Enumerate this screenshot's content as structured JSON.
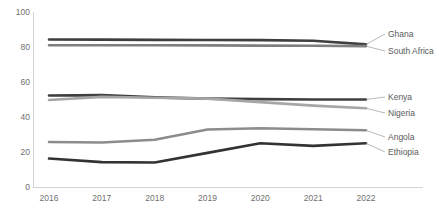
{
  "chart": {
    "type": "line",
    "title": "",
    "xlabel": "",
    "ylabel": ""
  },
  "axes": {
    "y_ticks": [
      "0",
      "20",
      "40",
      "60",
      "80",
      "100"
    ],
    "x_ticks": [
      "2016",
      "2017",
      "2018",
      "2019",
      "2020",
      "2021",
      "2022"
    ]
  },
  "labels": {
    "ghana": "Ghana",
    "south_africa": "South Africa",
    "kenya": "Kenya",
    "nigeria": "Nigeria",
    "angola": "Angola",
    "ethiopia": "Ethiopia"
  },
  "chart_data": {
    "type": "line",
    "title": "",
    "xlabel": "",
    "ylabel": "",
    "x": [
      2016,
      2017,
      2018,
      2019,
      2020,
      2021,
      2022
    ],
    "categories": [
      "2016",
      "2017",
      "2018",
      "2019",
      "2020",
      "2021",
      "2022"
    ],
    "ylim": [
      0,
      100
    ],
    "xlim": [
      2016,
      2022
    ],
    "yticks": [
      0,
      20,
      40,
      60,
      80,
      100
    ],
    "grid": false,
    "legend": "right-inline-labels",
    "series": [
      {
        "name": "Ghana",
        "color": "#3f3f3f",
        "values": [
          84.3,
          84.2,
          84.1,
          84.0,
          83.9,
          83.6,
          81.5
        ]
      },
      {
        "name": "South Africa",
        "color": "#7f7f7f",
        "values": [
          81.0,
          81.0,
          81.0,
          80.9,
          80.8,
          80.7,
          80.5
        ]
      },
      {
        "name": "Kenya",
        "color": "#3f3f3f",
        "values": [
          52.3,
          52.5,
          51.2,
          50.5,
          50.2,
          50.0,
          50.0
        ]
      },
      {
        "name": "Nigeria",
        "color": "#a6a6a6",
        "values": [
          49.7,
          51.5,
          51.0,
          50.5,
          48.5,
          46.5,
          45.0
        ]
      },
      {
        "name": "Angola",
        "color": "#8c8c8c",
        "values": [
          25.7,
          25.4,
          27.0,
          32.9,
          33.6,
          33.0,
          32.4
        ]
      },
      {
        "name": "Ethiopia",
        "color": "#333333",
        "values": [
          16.3,
          14.2,
          14.0,
          19.5,
          25.0,
          23.5,
          25.0
        ]
      }
    ]
  }
}
